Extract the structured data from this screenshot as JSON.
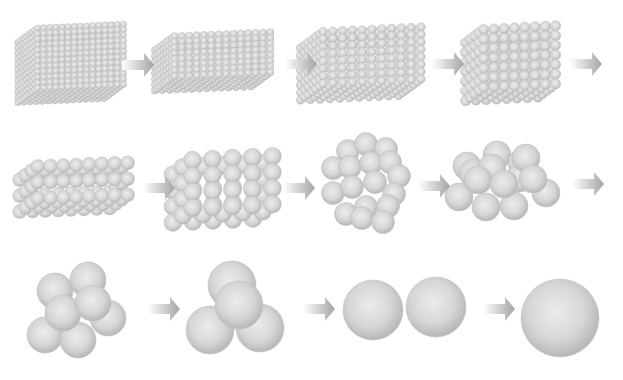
{
  "figure": {
    "title": "",
    "background": "#ffffff",
    "sphere_colors": {
      "highlight": "#ececec",
      "mid": "#d6d6d6",
      "edge": "#b4b4b4",
      "stroke": "#c2c2c2"
    },
    "arrow_colors": {
      "start": "#ffffff",
      "end": "#a4a4a4"
    }
  },
  "stages": [
    {
      "id": 1,
      "type": "box",
      "cx": 70,
      "cy": 62,
      "w": 86,
      "h": 60,
      "depth": 26,
      "r": 3.2,
      "nx": 15,
      "ny": 12,
      "nz": 8
    },
    {
      "id": 2,
      "type": "box",
      "cx": 212,
      "cy": 60,
      "w": 96,
      "h": 40,
      "depth": 26,
      "r": 3.6,
      "nx": 14,
      "ny": 8,
      "nz": 8
    },
    {
      "id": 3,
      "type": "box",
      "cx": 360,
      "cy": 62,
      "w": 98,
      "h": 52,
      "depth": 30,
      "r": 4.3,
      "nx": 11,
      "ny": 8,
      "nz": 7
    },
    {
      "id": 4,
      "type": "box",
      "cx": 510,
      "cy": 62,
      "w": 72,
      "h": 58,
      "depth": 24,
      "r": 5.2,
      "nx": 8,
      "ny": 7,
      "nz": 5
    },
    {
      "id": 5,
      "type": "box",
      "cx": 73,
      "cy": 186,
      "w": 90,
      "h": 32,
      "depth": 24,
      "r": 7,
      "nx": 8,
      "ny": 3,
      "nz": 4
    },
    {
      "id": 6,
      "type": "box",
      "cx": 222,
      "cy": 188,
      "w": 80,
      "h": 48,
      "depth": 26,
      "r": 9,
      "nx": 5,
      "ny": 4,
      "nz": 3
    },
    {
      "id": 7,
      "type": "list",
      "r": 11.5,
      "spheres": [
        [
          348,
          151
        ],
        [
          366,
          144
        ],
        [
          386,
          149
        ],
        [
          333,
          168
        ],
        [
          350,
          167
        ],
        [
          371,
          163
        ],
        [
          390,
          162
        ],
        [
          399,
          176
        ],
        [
          333,
          193
        ],
        [
          352,
          187
        ],
        [
          375,
          182
        ],
        [
          394,
          194
        ],
        [
          346,
          214
        ],
        [
          366,
          207
        ],
        [
          388,
          206
        ],
        [
          362,
          218
        ],
        [
          383,
          222
        ]
      ]
    },
    {
      "id": 8,
      "type": "list",
      "r": 14,
      "spheres": [
        [
          467,
          166
        ],
        [
          497,
          155
        ],
        [
          522,
          163
        ],
        [
          473,
          173
        ],
        [
          492,
          168
        ],
        [
          520,
          178
        ],
        [
          526,
          158
        ],
        [
          459,
          197
        ],
        [
          486,
          207
        ],
        [
          514,
          206
        ],
        [
          546,
          193
        ],
        [
          478,
          180
        ],
        [
          504,
          184
        ],
        [
          533,
          179
        ]
      ]
    },
    {
      "id": 9,
      "type": "list",
      "r": 18,
      "spheres": [
        [
          55,
          291
        ],
        [
          88,
          280
        ],
        [
          108,
          318
        ],
        [
          45,
          335
        ],
        [
          78,
          340
        ],
        [
          63,
          313
        ],
        [
          93,
          303
        ]
      ]
    },
    {
      "id": 10,
      "type": "list",
      "r": 24,
      "spheres": [
        [
          232,
          285
        ],
        [
          210,
          330
        ],
        [
          260,
          328
        ],
        [
          239,
          305
        ]
      ]
    },
    {
      "id": 11,
      "type": "list",
      "r": 30,
      "spheres": [
        [
          373,
          310
        ],
        [
          436,
          307
        ]
      ]
    },
    {
      "id": 12,
      "type": "list",
      "r": 39,
      "spheres": [
        [
          560,
          318
        ]
      ]
    }
  ],
  "arrows": [
    {
      "x": 122,
      "y": 65,
      "w": 32
    },
    {
      "x": 285,
      "y": 64,
      "w": 32
    },
    {
      "x": 432,
      "y": 64,
      "w": 32
    },
    {
      "x": 570,
      "y": 64,
      "w": 32
    },
    {
      "x": 143,
      "y": 188,
      "w": 32
    },
    {
      "x": 283,
      "y": 188,
      "w": 32
    },
    {
      "x": 418,
      "y": 186,
      "w": 32
    },
    {
      "x": 572,
      "y": 184,
      "w": 32
    },
    {
      "x": 148,
      "y": 309,
      "w": 32
    },
    {
      "x": 303,
      "y": 309,
      "w": 32
    },
    {
      "x": 483,
      "y": 309,
      "w": 32
    }
  ]
}
